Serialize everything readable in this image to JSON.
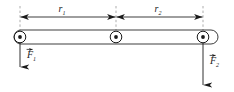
{
  "figure": {
    "kind": "physics-free-body-diagram",
    "colors": {
      "stroke": "#1a1a1a",
      "rod_fill": "#ffffff",
      "pivot_fill": "#1a1a1a",
      "background": "#ffffff",
      "dashed": "#8a8a8a"
    },
    "rod": {
      "name": "rod",
      "x_start": 14,
      "x_end": 218,
      "y_top": 30,
      "y_bottom": 44
    },
    "pivots": [
      {
        "label": "left-pivot",
        "x": 20,
        "y": 37,
        "outer_r": 6.0,
        "inner_r": 2.0
      },
      {
        "label": "center-pivot",
        "x": 116,
        "y": 37,
        "outer_r": 6.0,
        "inner_r": 2.0
      },
      {
        "label": "right-pivot",
        "x": 203,
        "y": 37,
        "outer_r": 6.0,
        "inner_r": 2.0
      }
    ],
    "dimensions": [
      {
        "id": "r1",
        "label": "r",
        "subscript": "1",
        "label_x": 62,
        "label_y": 11,
        "line_y": 17,
        "x_from": 20,
        "x_to": 116
      },
      {
        "id": "r2",
        "label": "r",
        "subscript": "2",
        "label_x": 158,
        "label_y": 11,
        "line_y": 17,
        "x_from": 116,
        "x_to": 203
      }
    ],
    "extension_lines": [
      {
        "id": "ext-left",
        "x": 20,
        "y_from": 6,
        "y_to": 31
      },
      {
        "id": "ext-center",
        "x": 116,
        "y_from": 6,
        "y_to": 31
      },
      {
        "id": "ext-right",
        "x": 203,
        "y_from": 6,
        "y_to": 31
      }
    ],
    "forces": [
      {
        "id": "F1",
        "label": "F",
        "subscript": "1",
        "vector_arrow": true,
        "x": 20,
        "y_from": 37,
        "y_to": 68,
        "label_x": 28,
        "label_y": 58,
        "direction": "down"
      },
      {
        "id": "F2",
        "label": "F",
        "subscript": "2",
        "vector_arrow": true,
        "x": 203,
        "y_from": 37,
        "y_to": 86,
        "label_x": 211,
        "label_y": 64,
        "direction": "down"
      }
    ]
  }
}
